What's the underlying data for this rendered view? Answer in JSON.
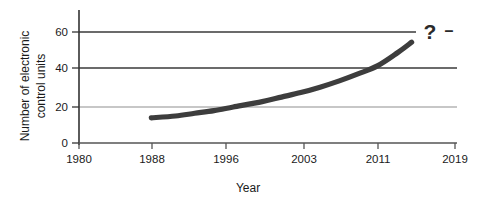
{
  "chart_data": {
    "type": "line",
    "title": "",
    "subtitle": "",
    "xlabel": "Year",
    "ylabel": "Number of electronic control units",
    "ylabel_lines": [
      "Number of electronic",
      "control units"
    ],
    "x": [
      1987.5,
      1990,
      1992,
      1994,
      1996,
      1999,
      2001,
      2003,
      2005,
      2007,
      2009,
      2011,
      2013,
      2014.5
    ],
    "values": [
      14,
      15,
      16.5,
      18,
      20,
      23,
      25.5,
      28,
      31,
      34.5,
      38.5,
      43,
      50,
      56
    ],
    "series": [
      {
        "name": "Number of electronic control units",
        "color": "#3d3d3d",
        "values": [
          14,
          15,
          16.5,
          18,
          20,
          23,
          25.5,
          28,
          31,
          34.5,
          38.5,
          43,
          50,
          56
        ]
      }
    ],
    "xticks": [
      1980,
      1988,
      1996,
      2003,
      2011,
      2019
    ],
    "xtick_labels": [
      "1980",
      "1988",
      "1996",
      "2003",
      "2011",
      "2019"
    ],
    "yticks": [
      0,
      20,
      40,
      60
    ],
    "ytick_labels": [
      "0",
      "20",
      "40",
      "60"
    ],
    "xlim": [
      1980,
      2019
    ],
    "ylim": [
      0,
      68
    ],
    "grid": "horizontal",
    "legend": "none",
    "annotations": [
      {
        "text": "?",
        "x": 2016.5,
        "y": 61,
        "note": "future value unknown"
      },
      {
        "text": "–",
        "x": 2018.5,
        "y": 61,
        "note": "dash after question mark"
      }
    ],
    "line_start_value": 14,
    "line_end_value": 56,
    "line_start_year": 1988,
    "line_end_year": 2014
  },
  "colors": {
    "background": "#ffffff",
    "axis": "#333333",
    "gridline_major": "#3a3a3a",
    "gridline_minor": "#9a9a9a",
    "line": "#3d3d3d",
    "text": "#1a1a1a"
  }
}
